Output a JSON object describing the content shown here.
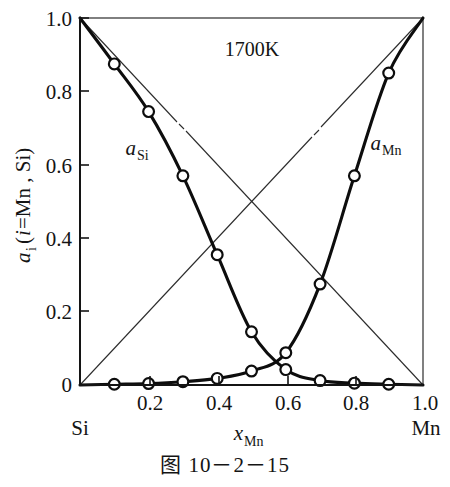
{
  "figure": {
    "caption": "图 10－2－15",
    "annotation": "1700K"
  },
  "axes": {
    "y_title_main": "a",
    "y_title_sub": "i",
    "y_title_paren_open": " (",
    "y_title_i": "i",
    "y_title_rest": "=Mn , Si)",
    "x_title_main": "x",
    "x_title_sub": "Mn",
    "x_corner_left": "Si",
    "x_corner_right": "Mn",
    "x_ticks": [
      "0",
      "0.2",
      "0.4",
      "0.6",
      "0.8",
      "1.0"
    ],
    "y_ticks": [
      "0",
      "0.2",
      "0.4",
      "0.6",
      "0.8",
      "1.0"
    ]
  },
  "series_labels": {
    "si_main": "a",
    "si_sub": "Si",
    "mn_main": "a",
    "mn_sub": "Mn"
  },
  "chart_data": {
    "type": "line",
    "title": "",
    "annotation": "1700K",
    "xlabel": "x_Mn",
    "ylabel": "a_i (i=Mn, Si)",
    "xlim": [
      0,
      1
    ],
    "ylim": [
      0,
      1
    ],
    "xticks": [
      0,
      0.2,
      0.4,
      0.6,
      0.8,
      1.0
    ],
    "yticks": [
      0,
      0.2,
      0.4,
      0.6,
      0.8,
      1.0
    ],
    "grid": false,
    "legend": "inline-curve-labels",
    "x_axis_endpoints": {
      "left": "Si",
      "right": "Mn"
    },
    "x": [
      0,
      0.1,
      0.2,
      0.3,
      0.4,
      0.5,
      0.6,
      0.7,
      0.8,
      0.9,
      1.0
    ],
    "series": [
      {
        "name": "a_Si",
        "style": "thick-solid-with-open-circle-markers",
        "marker_x": [
          0.1,
          0.2,
          0.3,
          0.4,
          0.5,
          0.6,
          0.7,
          0.8,
          0.9
        ],
        "values": [
          1.0,
          0.875,
          0.745,
          0.57,
          0.355,
          0.145,
          0.042,
          0.012,
          0.005,
          0.002,
          0.0
        ]
      },
      {
        "name": "a_Mn",
        "style": "thick-solid-with-open-circle-markers",
        "marker_x": [
          0.1,
          0.2,
          0.3,
          0.4,
          0.5,
          0.6,
          0.7,
          0.8,
          0.9
        ],
        "values": [
          0.0,
          0.002,
          0.004,
          0.009,
          0.018,
          0.038,
          0.088,
          0.275,
          0.57,
          0.85,
          1.0
        ]
      },
      {
        "name": "Raoult ideal line for a_Si",
        "style": "thin-solid-dash-break",
        "values": [
          1.0,
          0.9,
          0.8,
          0.7,
          0.6,
          0.5,
          0.4,
          0.3,
          0.2,
          0.1,
          0.0
        ]
      },
      {
        "name": "Raoult ideal line for a_Mn",
        "style": "thin-solid-dash-break",
        "values": [
          0.0,
          0.1,
          0.2,
          0.3,
          0.4,
          0.5,
          0.6,
          0.7,
          0.8,
          0.9,
          1.0
        ]
      }
    ]
  }
}
